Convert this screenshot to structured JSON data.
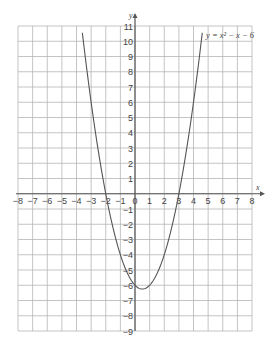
{
  "chart_data": {
    "type": "line",
    "title": "",
    "xlabel": "x",
    "ylabel": "y",
    "xlim": [
      -8,
      8
    ],
    "ylim": [
      -9,
      11
    ],
    "grid": true,
    "x_ticks": [
      -8,
      -7,
      -6,
      -5,
      -4,
      -3,
      -2,
      -1,
      0,
      1,
      2,
      3,
      4,
      5,
      6,
      7,
      8
    ],
    "y_ticks": [
      11,
      10,
      9,
      8,
      7,
      6,
      5,
      4,
      3,
      2,
      1,
      -1,
      -2,
      -3,
      -4,
      -5,
      -6,
      -7,
      -8,
      -9
    ],
    "series": [
      {
        "name": "y = x² − x − 6",
        "equation": "y = x^2 - x - 6",
        "x_range": [
          -3.6,
          4.6
        ],
        "vertex": [
          0.5,
          -6.25
        ],
        "roots": [
          -2,
          3
        ]
      }
    ],
    "annotations": [
      {
        "text": "y = x² − x − 6",
        "position": "top-right"
      }
    ]
  },
  "labels": {
    "x_axis": "x",
    "y_axis": "y",
    "equation": "y = x² − x − 6"
  }
}
